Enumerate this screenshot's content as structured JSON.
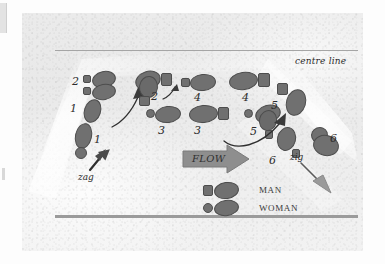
{
  "diagram": {
    "centre_line_label": "centre line",
    "flow_label": "FLOW",
    "zag_label": "zag",
    "zig_label": "zig",
    "colors": {
      "footprint_fill": "#707070",
      "footprint_stroke": "#4d4d4d",
      "flow_arrow": "#8e8e8e",
      "line": "#9a9a9a",
      "paper": "#ebebeb",
      "ink": "#2b2b2b"
    },
    "step_numbers": {
      "n1a": "1",
      "n1b": "1",
      "n2a": "2",
      "n2b": "2",
      "n3a": "3",
      "n3b": "3",
      "n4a": "4",
      "n4b": "4",
      "n5a": "5",
      "n5b": "5",
      "n6a": "6",
      "n6b": "6"
    },
    "legend": {
      "man_label": "MAN",
      "woman_label": "WOMAN"
    }
  }
}
